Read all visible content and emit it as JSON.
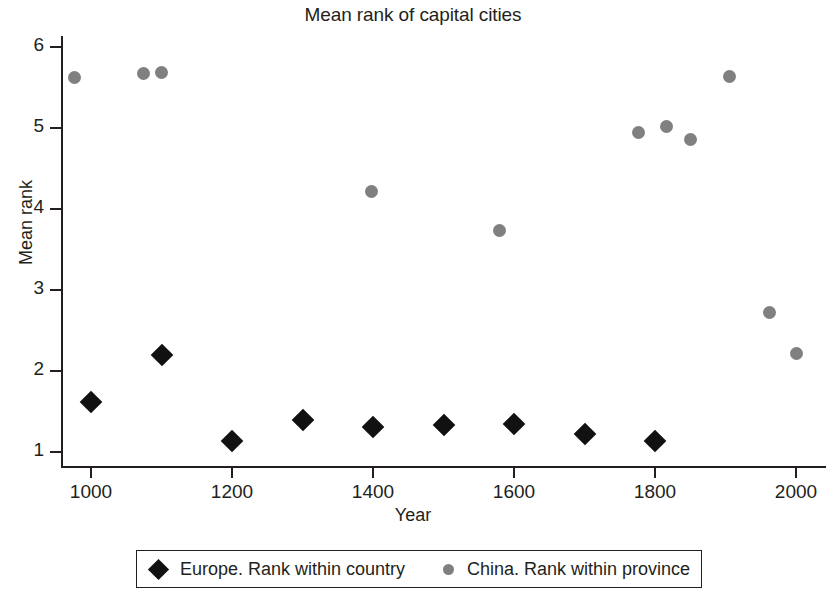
{
  "chart_data": {
    "type": "scatter",
    "title": "Mean rank of capital cities",
    "xlabel": "Year",
    "ylabel": "Mean rank",
    "xlim": [
      950,
      2020
    ],
    "ylim": [
      0.75,
      6.3
    ],
    "xticks": [
      1000,
      1200,
      1400,
      1600,
      1800,
      2000
    ],
    "yticks": [
      1,
      2,
      3,
      4,
      5,
      6
    ],
    "grid": false,
    "legend_position": "below",
    "series": [
      {
        "name": "Europe. Rank within country",
        "marker": "diamond",
        "color": "#111111",
        "points": [
          {
            "x": 1000,
            "y": 1.62
          },
          {
            "x": 1100,
            "y": 2.2
          },
          {
            "x": 1200,
            "y": 1.13
          },
          {
            "x": 1300,
            "y": 1.4
          },
          {
            "x": 1400,
            "y": 1.31
          },
          {
            "x": 1500,
            "y": 1.33
          },
          {
            "x": 1600,
            "y": 1.34
          },
          {
            "x": 1700,
            "y": 1.22
          },
          {
            "x": 1800,
            "y": 1.13
          }
        ]
      },
      {
        "name": "China. Rank within province",
        "marker": "circle",
        "color": "#808080",
        "points": [
          {
            "x": 976,
            "y": 5.62
          },
          {
            "x": 1075,
            "y": 5.67
          },
          {
            "x": 1100,
            "y": 5.69
          },
          {
            "x": 1398,
            "y": 4.21
          },
          {
            "x": 1580,
            "y": 3.73
          },
          {
            "x": 1776,
            "y": 4.95
          },
          {
            "x": 1816,
            "y": 5.02
          },
          {
            "x": 1850,
            "y": 4.86
          },
          {
            "x": 1906,
            "y": 5.64
          },
          {
            "x": 1962,
            "y": 2.72
          },
          {
            "x": 2000,
            "y": 2.22
          }
        ]
      }
    ]
  },
  "legend": {
    "entries": [
      {
        "label": "Europe. Rank within country"
      },
      {
        "label": "China. Rank within province"
      }
    ]
  }
}
